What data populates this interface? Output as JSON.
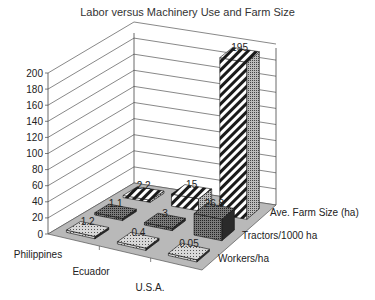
{
  "chart_data": {
    "type": "bar",
    "subtype": "3d-column",
    "title": "Labor versus Machinery Use and Farm Size",
    "categories": [
      "Philippines",
      "Ecuador",
      "U.S.A."
    ],
    "series": [
      {
        "name": "Workers/ha",
        "values": [
          1.2,
          0.4,
          0.05
        ],
        "labels": [
          "1.2",
          "0.4",
          "0.05"
        ],
        "pattern": "dots"
      },
      {
        "name": "Tractors/1000 ha",
        "values": [
          1.1,
          3,
          26.8
        ],
        "labels": [
          "1.1",
          "3",
          "26.8"
        ],
        "pattern": "cross"
      },
      {
        "name": "Ave. Farm Size (ha)",
        "values": [
          2.2,
          15,
          195
        ],
        "labels": [
          "2.2",
          "15",
          "195"
        ],
        "pattern": "diagonal"
      }
    ],
    "yticks": [
      "0",
      "20",
      "40",
      "60",
      "80",
      "100",
      "120",
      "140",
      "160",
      "180",
      "200"
    ],
    "ylim": [
      0,
      200
    ],
    "xlabel": "",
    "ylabel": "",
    "grid": true,
    "legend": "none (series names shown as depth-axis labels)"
  },
  "colors": {
    "floor": "#b9b9b9",
    "grid": "#555555",
    "bar_dark": "#2a2a2a"
  }
}
